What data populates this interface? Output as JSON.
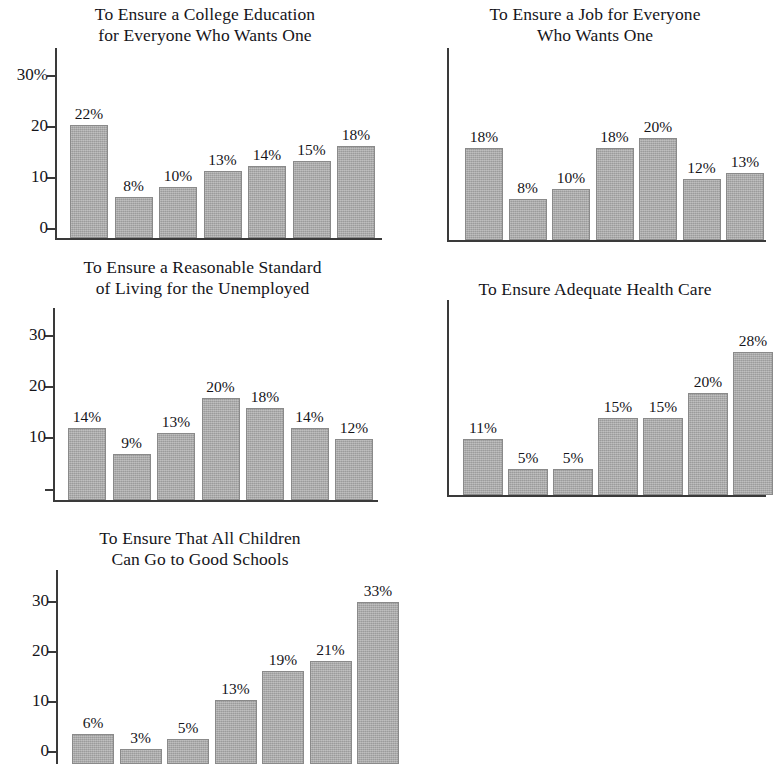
{
  "figure": {
    "background_color": "#ffffff",
    "bar_color": "#aaaaaa",
    "axis_color": "#3a3a3a",
    "text_color": "#15151a"
  },
  "chart_data": [
    {
      "id": "college-education",
      "type": "bar",
      "title": "To Ensure a College Education\nfor Everyone Who Wants One",
      "title_lines": [
        "To Ensure a College Education",
        "for Everyone Who Wants One"
      ],
      "categories": [
        "1",
        "2",
        "3",
        "4",
        "5",
        "6",
        "7"
      ],
      "values": [
        22,
        8,
        10,
        13,
        14,
        15,
        18
      ],
      "data_labels": [
        "22%",
        "8%",
        "10%",
        "13%",
        "14%",
        "15%",
        "18%"
      ],
      "ytick_labels": [
        "30%",
        "20",
        "10",
        "0"
      ],
      "ytick_values": [
        30,
        20,
        10,
        0
      ],
      "ylim": [
        0,
        35
      ],
      "xlabel": "",
      "ylabel": "",
      "grid": false,
      "legend": false
    },
    {
      "id": "job-for-everyone",
      "type": "bar",
      "title": "To Ensure a Job for Everyone\nWho Wants One",
      "title_lines": [
        "To Ensure a Job for Everyone",
        "Who Wants One"
      ],
      "categories": [
        "1",
        "2",
        "3",
        "4",
        "5",
        "6",
        "7"
      ],
      "values": [
        18,
        8,
        10,
        18,
        20,
        12,
        13
      ],
      "data_labels": [
        "18%",
        "8%",
        "10%",
        "18%",
        "20%",
        "12%",
        "13%"
      ],
      "ytick_labels": [],
      "ytick_values": [],
      "ylim": [
        0,
        35
      ],
      "xlabel": "",
      "ylabel": "",
      "grid": false,
      "legend": false
    },
    {
      "id": "standard-of-living",
      "type": "bar",
      "title": "To Ensure a Reasonable Standard\nof Living for the Unemployed",
      "title_lines": [
        "To Ensure a Reasonable Standard",
        "of Living for the Unemployed"
      ],
      "categories": [
        "1",
        "2",
        "3",
        "4",
        "5",
        "6",
        "7"
      ],
      "values": [
        14,
        9,
        13,
        20,
        18,
        14,
        12
      ],
      "data_labels": [
        "14%",
        "9%",
        "13%",
        "20%",
        "18%",
        "14%",
        "12%"
      ],
      "ytick_labels": [
        "30",
        "20",
        "10",
        ""
      ],
      "ytick_values": [
        30,
        20,
        10,
        0
      ],
      "ylim": [
        0,
        35
      ],
      "xlabel": "",
      "ylabel": "",
      "grid": false,
      "legend": false
    },
    {
      "id": "adequate-health-care",
      "type": "bar",
      "title": "To Ensure Adequate Health Care",
      "title_lines": [
        "To Ensure Adequate Health Care"
      ],
      "categories": [
        "1",
        "2",
        "3",
        "4",
        "5",
        "6",
        "7"
      ],
      "values": [
        11,
        5,
        5,
        15,
        15,
        20,
        28
      ],
      "data_labels": [
        "11%",
        "5%",
        "5%",
        "15%",
        "15%",
        "20%",
        "28%"
      ],
      "ytick_labels": [],
      "ytick_values": [],
      "ylim": [
        0,
        35
      ],
      "xlabel": "",
      "ylabel": "",
      "grid": false,
      "legend": false
    },
    {
      "id": "good-schools",
      "type": "bar",
      "title": "To Ensure That All Children\nCan Go to Good Schools",
      "title_lines": [
        "To Ensure That All Children",
        "Can Go to Good Schools"
      ],
      "categories": [
        "1",
        "2",
        "3",
        "4",
        "5",
        "6",
        "7"
      ],
      "values": [
        6,
        3,
        5,
        13,
        19,
        21,
        33
      ],
      "data_labels": [
        "6%",
        "3%",
        "5%",
        "13%",
        "19%",
        "21%",
        "33%"
      ],
      "ytick_labels": [
        "30",
        "20",
        "10",
        "0"
      ],
      "ytick_values": [
        30,
        20,
        10,
        0
      ],
      "ylim": [
        0,
        37
      ],
      "xlabel": "",
      "ylabel": "",
      "grid": false,
      "legend": false
    }
  ]
}
